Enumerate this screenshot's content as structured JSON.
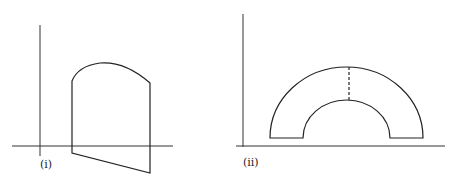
{
  "figure": {
    "panels": [
      {
        "label": "(i)",
        "description": "Region bounded by two vertical lines, a concave-down arc on top and a slanted line below the x-axis"
      },
      {
        "label": "(ii)",
        "description": "Half-annulus region above the x-axis with a dashed vertical segment at its center"
      }
    ]
  }
}
